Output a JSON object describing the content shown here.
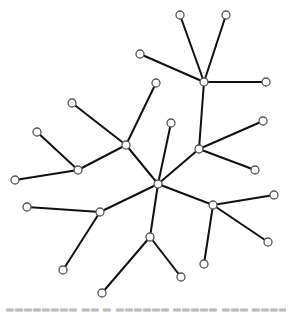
{
  "diagram": {
    "type": "tree-network",
    "node_radius": 4,
    "edge_color": "#111111",
    "node_stroke": "#555555",
    "node_fill": "#ffffff",
    "nodes": [
      {
        "id": "n0",
        "x": 158,
        "y": 184,
        "role": "root-hub"
      },
      {
        "id": "n1",
        "x": 126,
        "y": 145,
        "role": "hub"
      },
      {
        "id": "n2",
        "x": 199,
        "y": 149,
        "role": "hub"
      },
      {
        "id": "n3",
        "x": 204,
        "y": 82,
        "role": "hub"
      },
      {
        "id": "n4",
        "x": 100,
        "y": 212,
        "role": "hub"
      },
      {
        "id": "n5",
        "x": 213,
        "y": 205,
        "role": "hub"
      },
      {
        "id": "n6",
        "x": 150,
        "y": 237,
        "role": "hub"
      },
      {
        "id": "n7",
        "x": 78,
        "y": 170,
        "role": "hub"
      },
      {
        "id": "n8",
        "x": 171,
        "y": 123,
        "role": "leaf"
      },
      {
        "id": "n9",
        "x": 180,
        "y": 15,
        "role": "leaf"
      },
      {
        "id": "n10",
        "x": 226,
        "y": 15,
        "role": "leaf"
      },
      {
        "id": "n11",
        "x": 266,
        "y": 82,
        "role": "leaf"
      },
      {
        "id": "n12",
        "x": 140,
        "y": 54,
        "role": "leaf"
      },
      {
        "id": "n13",
        "x": 156,
        "y": 83,
        "role": "leaf"
      },
      {
        "id": "n14",
        "x": 72,
        "y": 103,
        "role": "leaf"
      },
      {
        "id": "n15",
        "x": 37,
        "y": 132,
        "role": "leaf"
      },
      {
        "id": "n16",
        "x": 15,
        "y": 180,
        "role": "leaf"
      },
      {
        "id": "n17",
        "x": 263,
        "y": 121,
        "role": "leaf"
      },
      {
        "id": "n18",
        "x": 255,
        "y": 170,
        "role": "leaf"
      },
      {
        "id": "n19",
        "x": 274,
        "y": 195,
        "role": "leaf"
      },
      {
        "id": "n20",
        "x": 268,
        "y": 242,
        "role": "leaf"
      },
      {
        "id": "n21",
        "x": 204,
        "y": 264,
        "role": "leaf"
      },
      {
        "id": "n22",
        "x": 27,
        "y": 207,
        "role": "leaf"
      },
      {
        "id": "n23",
        "x": 63,
        "y": 270,
        "role": "leaf"
      },
      {
        "id": "n24",
        "x": 181,
        "y": 277,
        "role": "leaf"
      },
      {
        "id": "n25",
        "x": 102,
        "y": 293,
        "role": "leaf"
      }
    ],
    "edges": [
      [
        "n0",
        "n1"
      ],
      [
        "n0",
        "n8"
      ],
      [
        "n0",
        "n2"
      ],
      [
        "n0",
        "n4"
      ],
      [
        "n0",
        "n5"
      ],
      [
        "n0",
        "n6"
      ],
      [
        "n2",
        "n3"
      ],
      [
        "n2",
        "n17"
      ],
      [
        "n2",
        "n18"
      ],
      [
        "n3",
        "n9"
      ],
      [
        "n3",
        "n10"
      ],
      [
        "n3",
        "n11"
      ],
      [
        "n3",
        "n12"
      ],
      [
        "n1",
        "n13"
      ],
      [
        "n1",
        "n14"
      ],
      [
        "n1",
        "n7"
      ],
      [
        "n7",
        "n15"
      ],
      [
        "n7",
        "n16"
      ],
      [
        "n4",
        "n22"
      ],
      [
        "n4",
        "n23"
      ],
      [
        "n5",
        "n19"
      ],
      [
        "n5",
        "n20"
      ],
      [
        "n5",
        "n21"
      ],
      [
        "n6",
        "n24"
      ],
      [
        "n6",
        "n25"
      ]
    ]
  },
  "caption": {
    "text": "▂▂▂▂▂▂▂▂  ▂▂  ▂ ▂▂▂▂▂▂  ▂▂▂▂▂  ▂▂▂ ▂▂▂▂  ▂ ▂▂  ▂ ▂▂▂▂  ▂▂▂▂▂"
  }
}
